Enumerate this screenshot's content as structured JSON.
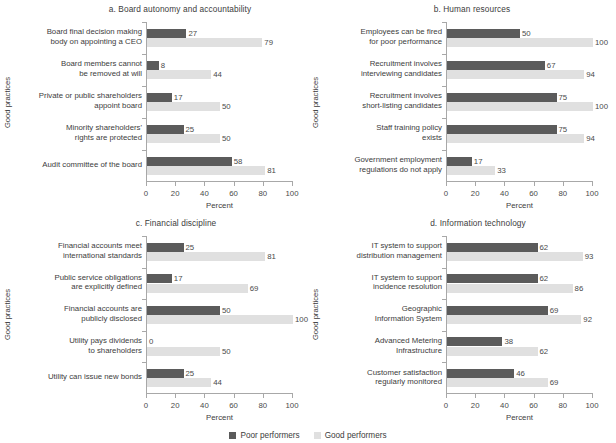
{
  "figure": {
    "xlabel": "Percent",
    "ylabel": "Good practices",
    "legend": [
      {
        "label": "Poor performers",
        "color": "#5b5b5b",
        "key": "poor"
      },
      {
        "label": "Good performers",
        "color": "#e0e0e0",
        "key": "good"
      }
    ],
    "xticks": [
      "0",
      "20",
      "40",
      "60",
      "80",
      "100"
    ]
  },
  "chart_data": [
    {
      "type": "bar",
      "id": "a",
      "title": "a. Board autonomy and accountability",
      "xlabel": "Percent",
      "ylabel": "Good practices",
      "xlim": [
        0,
        100
      ],
      "xticks": [
        0,
        20,
        40,
        60,
        80,
        100
      ],
      "orientation": "horizontal",
      "grid": false,
      "legend_position": "bottom-center",
      "categories": [
        "Board final decision making body on appointing a CEO",
        "Board members cannot be removed at will",
        "Private or public shareholders appoint board",
        "Minority shareholders' rights are protected",
        "Audit committee of the board"
      ],
      "category_lines": [
        [
          "Board final decision making",
          "body on appointing a CEO"
        ],
        [
          "Board members cannot",
          "be removed at will"
        ],
        [
          "Private or public shareholders",
          "appoint board"
        ],
        [
          "Minority shareholders'",
          "rights are protected"
        ],
        [
          "Audit committee of the board"
        ]
      ],
      "series": [
        {
          "name": "Poor performers",
          "values": [
            27,
            8,
            17,
            25,
            58
          ]
        },
        {
          "name": "Good performers",
          "values": [
            79,
            44,
            50,
            50,
            81
          ]
        }
      ]
    },
    {
      "type": "bar",
      "id": "b",
      "title": "b. Human resources",
      "xlabel": "Percent",
      "ylabel": "Good practices",
      "xlim": [
        0,
        100
      ],
      "xticks": [
        0,
        20,
        40,
        60,
        80,
        100
      ],
      "orientation": "horizontal",
      "grid": false,
      "legend_position": "bottom-center",
      "categories": [
        "Employees can be fired for poor performance",
        "Recruitment involves interviewing candidates",
        "Recruitment involves short-listing candidates",
        "Staff training policy exists",
        "Government employment regulations do not apply"
      ],
      "category_lines": [
        [
          "Employees can be fired",
          "for poor performance"
        ],
        [
          "Recruitment involves",
          "interviewing candidates"
        ],
        [
          "Recruitment involves",
          "short-listing candidates"
        ],
        [
          "Staff training policy",
          "exists"
        ],
        [
          "Government employment",
          "regulations do not apply"
        ]
      ],
      "series": [
        {
          "name": "Poor performers",
          "values": [
            50,
            67,
            75,
            75,
            17
          ]
        },
        {
          "name": "Good performers",
          "values": [
            100,
            94,
            100,
            94,
            33
          ]
        }
      ]
    },
    {
      "type": "bar",
      "id": "c",
      "title": "c. Financial discipline",
      "xlabel": "Percent",
      "ylabel": "Good practices",
      "xlim": [
        0,
        100
      ],
      "xticks": [
        0,
        20,
        40,
        60,
        80,
        100
      ],
      "orientation": "horizontal",
      "grid": false,
      "legend_position": "bottom-center",
      "categories": [
        "Financial accounts meet international standards",
        "Public service obligations are explicitly defined",
        "Financial accounts are publicly disclosed",
        "Utility pays dividends to shareholders",
        "Utility can issue new bonds"
      ],
      "category_lines": [
        [
          "Financial accounts meet",
          "international standards"
        ],
        [
          "Public service obligations",
          "are explicitly defined"
        ],
        [
          "Financial accounts are",
          "publicly disclosed"
        ],
        [
          "Utility pays dividends",
          "to shareholders"
        ],
        [
          "Utility can issue new bonds"
        ]
      ],
      "series": [
        {
          "name": "Poor performers",
          "values": [
            25,
            17,
            50,
            0,
            25
          ]
        },
        {
          "name": "Good performers",
          "values": [
            81,
            69,
            100,
            50,
            44
          ]
        }
      ]
    },
    {
      "type": "bar",
      "id": "d",
      "title": "d. Information technology",
      "xlabel": "Percent",
      "ylabel": "Good practices",
      "xlim": [
        0,
        100
      ],
      "xticks": [
        0,
        20,
        40,
        60,
        80,
        100
      ],
      "orientation": "horizontal",
      "grid": false,
      "legend_position": "bottom-center",
      "categories": [
        "IT system to support distribution management",
        "IT system to support incidence resolution",
        "Geographic Information System",
        "Advanced Metering Infrastructure",
        "Customer satisfaction regularly monitored"
      ],
      "category_lines": [
        [
          "IT system to support",
          "distribution management"
        ],
        [
          "IT system to support",
          "incidence resolution"
        ],
        [
          "Geographic",
          "Information System"
        ],
        [
          "Advanced Metering",
          "Infrastructure"
        ],
        [
          "Customer satisfaction",
          "regularly monitored"
        ]
      ],
      "series": [
        {
          "name": "Poor performers",
          "values": [
            62,
            62,
            69,
            38,
            46
          ]
        },
        {
          "name": "Good performers",
          "values": [
            93,
            86,
            92,
            62,
            69
          ]
        }
      ]
    }
  ]
}
